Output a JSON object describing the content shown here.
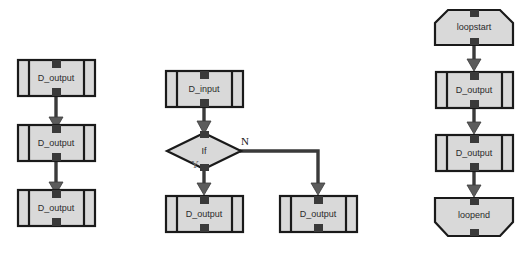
{
  "diagram": {
    "background_color": "#ffffff",
    "node_fill_color": "#d9d9d9",
    "node_stroke_color": "#1a1a1a",
    "connector_color": "#3a3a3a",
    "label_color": "#2b2b2b",
    "columns": [
      {
        "name": "sequence-column",
        "nodes": [
          {
            "id": "left-1",
            "label": "D_output",
            "shape": "subroutine-box"
          },
          {
            "id": "left-2",
            "label": "D_output",
            "shape": "subroutine-box"
          },
          {
            "id": "left-3",
            "label": "D_output",
            "shape": "subroutine-box"
          }
        ],
        "connectors": [
          {
            "from": "left-1",
            "to": "left-2",
            "label": ""
          },
          {
            "from": "left-2",
            "to": "left-3",
            "label": ""
          }
        ]
      },
      {
        "name": "branch-column",
        "nodes": [
          {
            "id": "mid-input",
            "label": "D_input",
            "shape": "subroutine-box"
          },
          {
            "id": "mid-if",
            "label": "If",
            "shape": "diamond"
          },
          {
            "id": "mid-yes",
            "label": "D_output",
            "shape": "subroutine-box"
          },
          {
            "id": "mid-no",
            "label": "D_output",
            "shape": "subroutine-box"
          }
        ],
        "connectors": [
          {
            "from": "mid-input",
            "to": "mid-if",
            "label": ""
          },
          {
            "from": "mid-if",
            "to": "mid-yes",
            "label": "Y"
          },
          {
            "from": "mid-if",
            "to": "mid-no",
            "label": "N"
          }
        ]
      },
      {
        "name": "loop-column",
        "nodes": [
          {
            "id": "loop-start",
            "label": "loopstart",
            "shape": "loop-start-hexagon"
          },
          {
            "id": "loop-body-1",
            "label": "D_output",
            "shape": "subroutine-box"
          },
          {
            "id": "loop-body-2",
            "label": "D_output",
            "shape": "subroutine-box"
          },
          {
            "id": "loop-end",
            "label": "loopend",
            "shape": "loop-end-hexagon"
          }
        ],
        "connectors": [
          {
            "from": "loop-start",
            "to": "loop-body-1",
            "label": ""
          },
          {
            "from": "loop-body-1",
            "to": "loop-body-2",
            "label": ""
          },
          {
            "from": "loop-body-2",
            "to": "loop-end",
            "label": ""
          }
        ]
      }
    ],
    "labels": {
      "left_1": "D_output",
      "left_2": "D_output",
      "left_3": "D_output",
      "mid_input": "D_input",
      "mid_if": "If",
      "mid_yes_box": "D_output",
      "mid_no_box": "D_output",
      "branch_yes": "Y",
      "branch_no": "N",
      "loop_start": "loopstart",
      "loop_body_1": "D_output",
      "loop_body_2": "D_output",
      "loop_end": "loopend"
    }
  }
}
